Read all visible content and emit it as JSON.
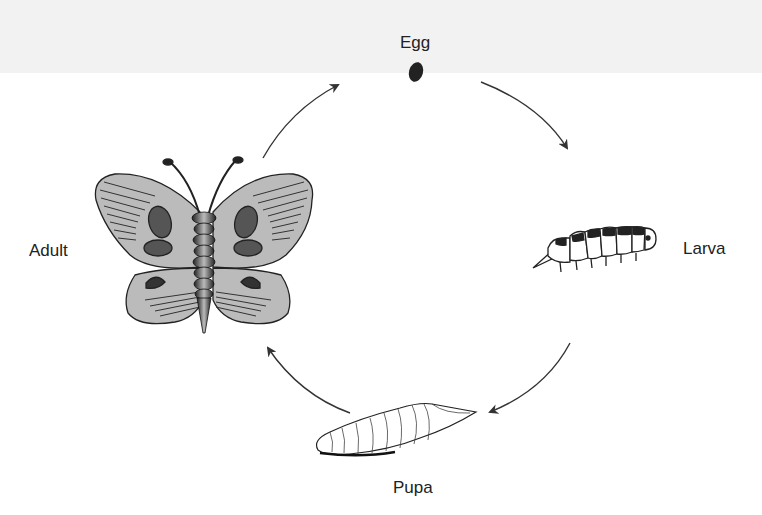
{
  "diagram": {
    "stages": [
      {
        "id": "egg",
        "label": "Egg"
      },
      {
        "id": "larva",
        "label": "Larva"
      },
      {
        "id": "pupa",
        "label": "Pupa"
      },
      {
        "id": "adult",
        "label": "Adult"
      }
    ],
    "arrows": [
      {
        "from": "egg",
        "to": "larva"
      },
      {
        "from": "larva",
        "to": "pupa"
      },
      {
        "from": "pupa",
        "to": "adult"
      },
      {
        "from": "adult",
        "to": "egg"
      }
    ],
    "colors": {
      "wing_fill": "#b8b8b8",
      "spot": "#555555",
      "outline": "#222222",
      "arrow": "#333333",
      "background": "#ffffff"
    }
  }
}
